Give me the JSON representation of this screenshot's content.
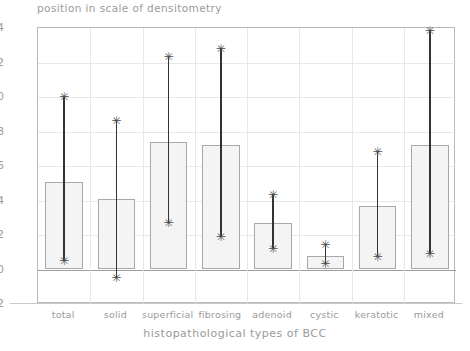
{
  "chart_data": {
    "type": "bar",
    "title": "",
    "ylabel": "position in scale of densitometry",
    "xlabel": "histopathological types of BCC",
    "ylim": [
      -2,
      14
    ],
    "ytick_labels": [
      "14",
      "12",
      "10",
      "8",
      "6",
      "4",
      "2",
      "0",
      "-2"
    ],
    "yticks": [
      14,
      12,
      10,
      8,
      6,
      4,
      2,
      0,
      -2
    ],
    "grid": true,
    "legend": "none",
    "categories": [
      "total",
      "solid",
      "superficial",
      "fibrosing",
      "adenoid",
      "cystic",
      "keratotic",
      "mixed"
    ],
    "values": [
      5.1,
      4.1,
      7.4,
      7.2,
      2.7,
      0.8,
      3.7,
      7.2
    ],
    "error_high": [
      10.0,
      8.6,
      12.3,
      12.8,
      4.3,
      1.4,
      6.8,
      13.8
    ],
    "error_low": [
      0.5,
      -0.5,
      2.7,
      1.9,
      1.2,
      0.3,
      0.7,
      0.9
    ],
    "marker": "asterisk",
    "bar_fill": "#f4f4f4",
    "bar_edge": "#a8a8a8",
    "errorbar_color": "#333333"
  },
  "marker_glyph": "✳"
}
